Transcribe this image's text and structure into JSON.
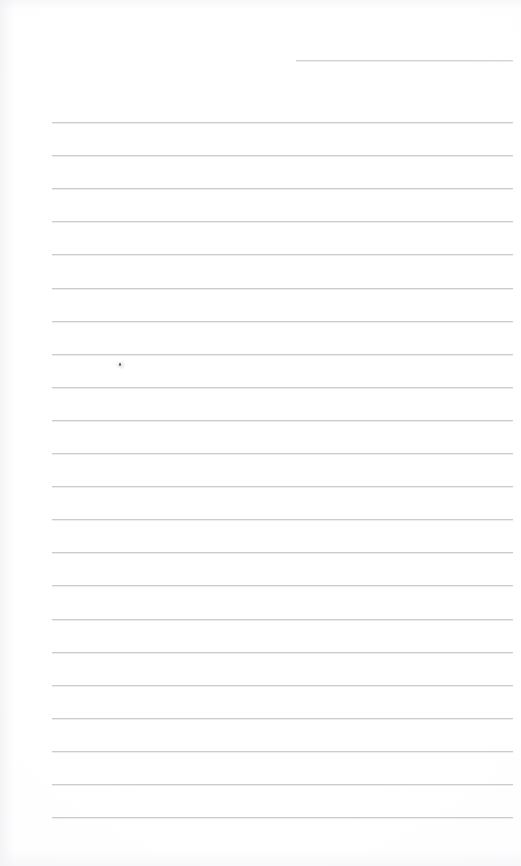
{
  "page": {
    "kind": "scanned-blank-ruled-notebook-page",
    "width": 521,
    "height": 866,
    "background_color": "#ffffff",
    "paper_tint_color": "#fdfdfe",
    "has_visible_text": false,
    "text_content": ""
  },
  "ruling": {
    "line_color": "#c9c9cf",
    "line_thickness_px": 1,
    "line_spacing_px": 33.1,
    "left_margin_x": 52,
    "right_margin_x": 513,
    "full_line_count": 22,
    "first_full_line_y": 122,
    "last_full_line_y": 817
  },
  "lines": [
    {
      "name": "ruled-line-partial-top",
      "y": 60,
      "x_start": 296,
      "x_end": 513,
      "partial": true
    },
    {
      "name": "ruled-line-1",
      "y": 122.0,
      "x_start": 52,
      "x_end": 513,
      "partial": false
    },
    {
      "name": "ruled-line-2",
      "y": 155.1,
      "x_start": 52,
      "x_end": 513,
      "partial": false
    },
    {
      "name": "ruled-line-3",
      "y": 188.2,
      "x_start": 52,
      "x_end": 513,
      "partial": false
    },
    {
      "name": "ruled-line-4",
      "y": 221.3,
      "x_start": 52,
      "x_end": 513,
      "partial": false
    },
    {
      "name": "ruled-line-5",
      "y": 254.4,
      "x_start": 52,
      "x_end": 513,
      "partial": false
    },
    {
      "name": "ruled-line-6",
      "y": 287.5,
      "x_start": 52,
      "x_end": 513,
      "partial": false
    },
    {
      "name": "ruled-line-7",
      "y": 320.6,
      "x_start": 52,
      "x_end": 513,
      "partial": false
    },
    {
      "name": "ruled-line-8",
      "y": 353.7,
      "x_start": 52,
      "x_end": 513,
      "partial": false
    },
    {
      "name": "ruled-line-9",
      "y": 386.8,
      "x_start": 52,
      "x_end": 513,
      "partial": false
    },
    {
      "name": "ruled-line-10",
      "y": 419.9,
      "x_start": 52,
      "x_end": 513,
      "partial": false
    },
    {
      "name": "ruled-line-11",
      "y": 453.0,
      "x_start": 52,
      "x_end": 513,
      "partial": false
    },
    {
      "name": "ruled-line-12",
      "y": 486.1,
      "x_start": 52,
      "x_end": 513,
      "partial": false
    },
    {
      "name": "ruled-line-13",
      "y": 519.2,
      "x_start": 52,
      "x_end": 513,
      "partial": false
    },
    {
      "name": "ruled-line-14",
      "y": 552.3,
      "x_start": 52,
      "x_end": 513,
      "partial": false
    },
    {
      "name": "ruled-line-15",
      "y": 585.4,
      "x_start": 52,
      "x_end": 513,
      "partial": false
    },
    {
      "name": "ruled-line-16",
      "y": 618.5,
      "x_start": 52,
      "x_end": 513,
      "partial": false
    },
    {
      "name": "ruled-line-17",
      "y": 651.6,
      "x_start": 52,
      "x_end": 513,
      "partial": false
    },
    {
      "name": "ruled-line-18",
      "y": 684.7,
      "x_start": 52,
      "x_end": 513,
      "partial": false
    },
    {
      "name": "ruled-line-19",
      "y": 717.8,
      "x_start": 52,
      "x_end": 513,
      "partial": false
    },
    {
      "name": "ruled-line-20",
      "y": 750.9,
      "x_start": 52,
      "x_end": 513,
      "partial": false
    },
    {
      "name": "ruled-line-21",
      "y": 784.0,
      "x_start": 52,
      "x_end": 513,
      "partial": false
    },
    {
      "name": "ruled-line-22",
      "y": 817.1,
      "x_start": 52,
      "x_end": 513,
      "partial": false
    }
  ],
  "marks": [
    {
      "name": "pen-dot",
      "x": 119,
      "y": 363,
      "width": 2,
      "height": 3,
      "color": "#53535a",
      "description": "small ink dot"
    }
  ]
}
